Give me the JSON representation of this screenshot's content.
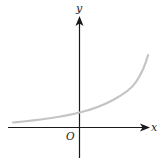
{
  "diagram": {
    "type": "function-graph",
    "axes": {
      "x_label": "x",
      "y_label": "y",
      "origin_label": "O"
    },
    "colors": {
      "axis": "#1a1a1a",
      "curve": "#c4c4c4",
      "label": "#222222",
      "background": "#ffffff"
    },
    "curve": {
      "shape": "exponential-growth",
      "y_intercept": "positive",
      "left_asymptote": "approaches x-axis from above"
    }
  }
}
